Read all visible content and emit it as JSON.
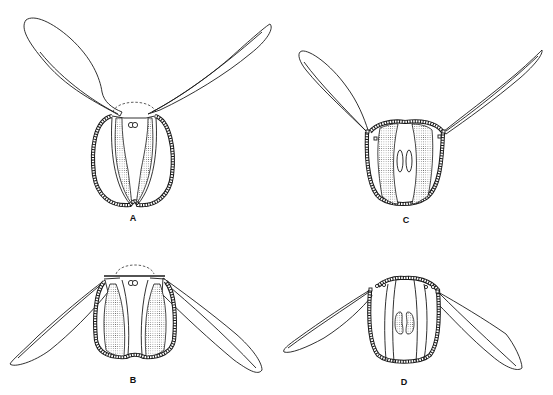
{
  "figure": {
    "panels": [
      {
        "id": "A",
        "label": "A",
        "description": "Ovoid body with two raised, upward-spreading wings; stippled paired inner bands converge at bottom; dashed arc above top; pair of small circles at top center"
      },
      {
        "id": "B",
        "label": "B",
        "description": "Body with wings spread downward-outward; stippled lateral lobes; dashed arc above top; pair of small circles at top center"
      },
      {
        "id": "C",
        "label": "C",
        "description": "Rounded body with two upward wings attached at small hinge nodes; broad stippled lateral zones; central paired elongated ovals"
      },
      {
        "id": "D",
        "label": "D",
        "description": "Rounded body with wings spread downward-outward from hinge nodes; central paired stippled kidney-shaped bodies"
      }
    ],
    "colors": {
      "line": "#1a1a1a",
      "background": "#ffffff"
    }
  }
}
